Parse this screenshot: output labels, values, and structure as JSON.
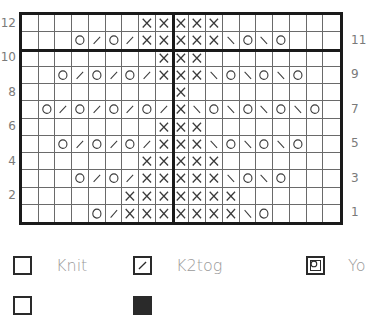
{
  "chart_data": {
    "type": "knitting-chart",
    "columns": 19,
    "rows": 12,
    "symbols": {
      ".": "knit",
      "/": "k2tog",
      "\\": "ssk",
      "O": "yo",
      "X": "purl"
    },
    "grid": [
      {
        "row": 12,
        "cells": ". . . . . . . X X X X X . . . . . . ."
      },
      {
        "row": 11,
        "cells": ". . . O / O / X X X X X \\ O \\ O . . ."
      },
      {
        "row": 10,
        "cells": ". . . . . . . . X X X . . . . . . . ."
      },
      {
        "row": 9,
        "cells": ". . O / O / O / X X X \\ O \\ O \\ O . ."
      },
      {
        "row": 8,
        "cells": ". . . . . . . . . X . . . . . . . . ."
      },
      {
        "row": 7,
        "cells": ". O / O / O / O / X \\ O \\ O \\ O \\ O ."
      },
      {
        "row": 6,
        "cells": ". . . . . . . . X X X . . . . . . . ."
      },
      {
        "row": 5,
        "cells": ". . O / O / O / X X X \\ O \\ O \\ O . ."
      },
      {
        "row": 4,
        "cells": ". . . . . . . X X X X X . . . . . . ."
      },
      {
        "row": 3,
        "cells": ". . . O / O / X X X X X \\ O \\ O . . ."
      },
      {
        "row": 2,
        "cells": ". . . . . . X X X X X X X . . . . . ."
      },
      {
        "row": 1,
        "cells": ". . . . O / X X X X X X X \\ O . . . ."
      }
    ],
    "left_labels": [
      "12",
      "10",
      "8",
      "6",
      "4",
      "2"
    ],
    "right_labels": [
      "11",
      "9",
      "7",
      "5",
      "3",
      "1"
    ],
    "center_divider_after_column": 9,
    "thick_row_divider_between": [
      10,
      11
    ]
  },
  "legend": [
    {
      "symbol": "knit",
      "label": "Knit"
    },
    {
      "symbol": "k2tog",
      "label": "K2tog"
    },
    {
      "symbol": "yo",
      "label": "Yo"
    }
  ],
  "colors": {
    "grid_line": "#6a6a6a",
    "border": "#1a1a1a",
    "symbol": "#3a3a3a",
    "label": "#7a7a7a",
    "legend_text": "#9a9a9a"
  }
}
